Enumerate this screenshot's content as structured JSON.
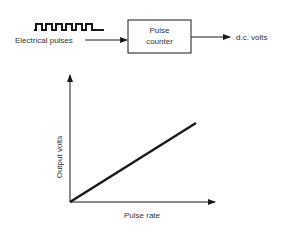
{
  "block_diagram": {
    "input_label": "Electrical pulses",
    "box_line1": "Pulse",
    "box_line2": "counter",
    "output_label": "d.c. volts"
  },
  "graph": {
    "y_axis_label": "Output volts",
    "x_axis_label": "Pulse rate"
  },
  "colors": {
    "stroke": "#1a1a1a",
    "text": "#333333",
    "background": "#ffffff"
  }
}
